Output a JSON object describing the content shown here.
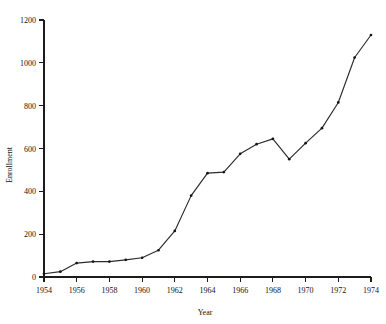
{
  "chart_data": {
    "type": "line",
    "title": "",
    "xlabel": "Year",
    "ylabel": "Enrollment",
    "xlim": [
      1954,
      1974
    ],
    "ylim": [
      0,
      1200
    ],
    "grid": false,
    "legend": "none",
    "x_ticks": [
      1954,
      1956,
      1958,
      1960,
      1962,
      1964,
      1966,
      1968,
      1970,
      1972,
      1974
    ],
    "x_tick_labels": [
      "1954",
      "1956",
      "1958",
      "1960",
      "1962",
      "1964",
      "1966",
      "1968",
      "1970",
      "1972",
      "1974"
    ],
    "y_ticks": [
      0,
      200,
      400,
      600,
      800,
      1000,
      1200
    ],
    "y_tick_labels": [
      "0",
      "200",
      "400",
      "600",
      "800",
      "1000",
      "1200"
    ],
    "x": [
      1954,
      1955,
      1956,
      1957,
      1958,
      1959,
      1960,
      1961,
      1962,
      1963,
      1964,
      1965,
      1966,
      1967,
      1968,
      1969,
      1970,
      1971,
      1972,
      1973,
      1974
    ],
    "values": [
      15,
      25,
      65,
      72,
      72,
      80,
      90,
      125,
      215,
      380,
      485,
      490,
      575,
      620,
      645,
      550,
      625,
      695,
      815,
      1025,
      1130
    ],
    "series": [
      {
        "name": "Enrollment",
        "values": [
          15,
          25,
          65,
          72,
          72,
          80,
          90,
          125,
          215,
          380,
          485,
          490,
          575,
          620,
          645,
          550,
          625,
          695,
          815,
          1025,
          1130
        ]
      }
    ],
    "marker": "point",
    "line_color": "#2b2b2b"
  }
}
